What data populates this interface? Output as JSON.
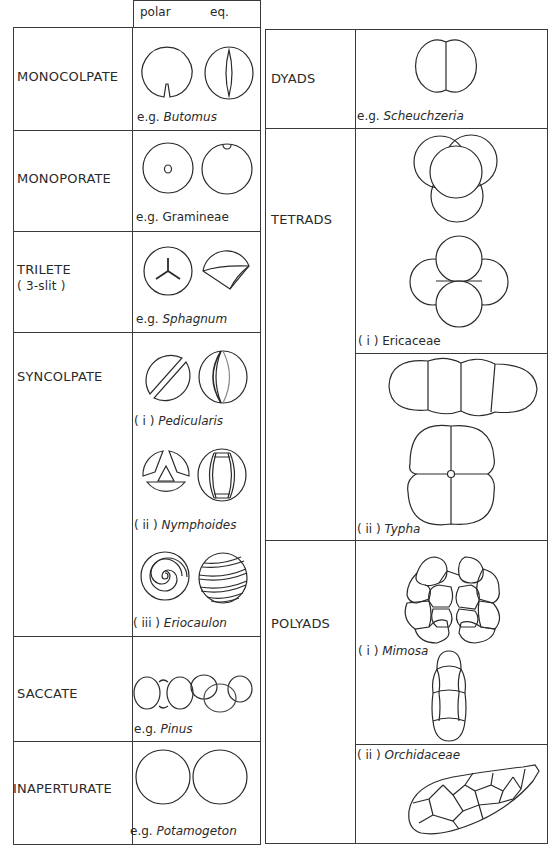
{
  "figure": {
    "header": {
      "polar": "polar",
      "equatorial": "eq."
    },
    "left_table": {
      "rows": [
        {
          "label": "MONOCOLPATE",
          "examples": [
            {
              "prefix": "e.g. ",
              "name": "Butomus",
              "italic": true
            }
          ]
        },
        {
          "label": "MONOPORATE",
          "examples": [
            {
              "prefix": "e.g. ",
              "name": "Gramineae",
              "italic": false
            }
          ]
        },
        {
          "label": "TRILETE",
          "sublabel": "( 3-slit )",
          "examples": [
            {
              "prefix": "e.g. ",
              "name": "Sphagnum",
              "italic": true
            }
          ]
        },
        {
          "label": "SYNCOLPATE",
          "examples": [
            {
              "prefix": "( i ) ",
              "name": "Pedicularis",
              "italic": true
            },
            {
              "prefix": "( ii ) ",
              "name": "Nymphoides",
              "italic": true
            },
            {
              "prefix": "( iii ) ",
              "name": "Eriocaulon",
              "italic": true
            }
          ]
        },
        {
          "label": "SACCATE",
          "examples": [
            {
              "prefix": "e.g. ",
              "name": "Pinus",
              "italic": true
            }
          ]
        },
        {
          "label": "INAPERTURATE",
          "examples": [
            {
              "prefix": "e.g. ",
              "name": "Potamogeton",
              "italic": true
            }
          ]
        }
      ]
    },
    "right_table": {
      "rows": [
        {
          "label": "DYADS",
          "examples": [
            {
              "prefix": "e.g. ",
              "name": "Scheuchzeria",
              "italic": true
            }
          ]
        },
        {
          "label": "TETRADS",
          "examples": [
            {
              "prefix": "( i ) ",
              "name": "Ericaceae",
              "italic": false
            },
            {
              "prefix": "( ii ) ",
              "name": "Typha",
              "italic": true
            }
          ]
        },
        {
          "label": "POLYADS",
          "examples": [
            {
              "prefix": "( i ) ",
              "name": "Mimosa",
              "italic": true
            },
            {
              "prefix": "( ii ) ",
              "name": "Orchidaceae",
              "italic": true
            }
          ]
        }
      ]
    }
  }
}
